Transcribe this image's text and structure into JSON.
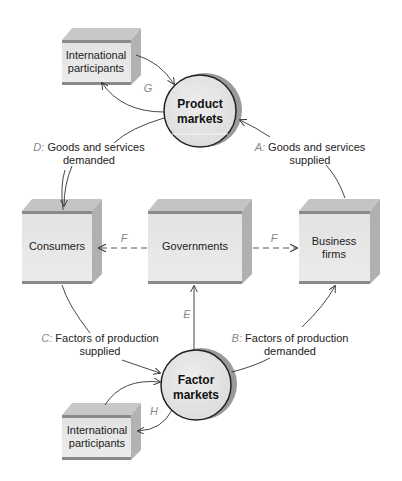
{
  "diagram": {
    "type": "circular-flow",
    "nodes": {
      "intl_top": {
        "line1": "International",
        "line2": "participants"
      },
      "product_markets": {
        "line1": "Product",
        "line2": "markets"
      },
      "consumers": {
        "label": "Consumers"
      },
      "governments": {
        "label": "Governments"
      },
      "business": {
        "line1": "Business",
        "line2": "firms"
      },
      "factor_markets": {
        "line1": "Factor",
        "line2": "markets"
      },
      "intl_bottom": {
        "line1": "International",
        "line2": "participants"
      }
    },
    "flows": {
      "A": {
        "letter": "A:",
        "line1": " Goods and services",
        "line2": "supplied"
      },
      "B": {
        "letter": "B:",
        "line1": " Factors of production",
        "line2": "demanded"
      },
      "C": {
        "letter": "C:",
        "line1": " Factors of production",
        "line2": "supplied"
      },
      "D": {
        "letter": "D:",
        "line1": " Goods and services",
        "line2": "demanded"
      },
      "E": {
        "letter": "E"
      },
      "F_left": {
        "letter": "F"
      },
      "F_right": {
        "letter": "F"
      },
      "G": {
        "letter": "G"
      },
      "H": {
        "letter": "H"
      }
    },
    "colors": {
      "box_front": "#e6e6e6",
      "box_top": "#c4c4c4",
      "box_side": "#b0b0b0",
      "box_band": "#8a8a8a",
      "circle_fill": "#e8e8e8",
      "circle_shadow": "#9a9a9a",
      "letter_gray": "#888888"
    }
  }
}
